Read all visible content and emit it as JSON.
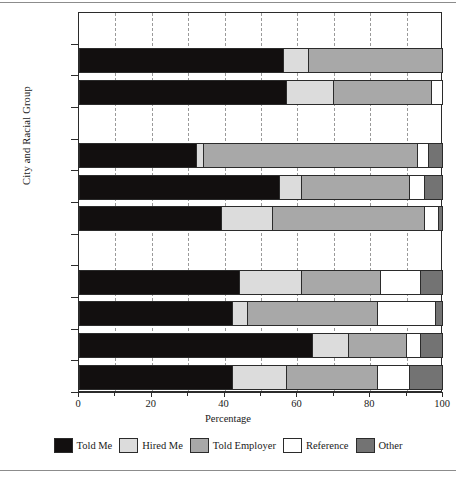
{
  "chart_data": {
    "type": "bar",
    "orientation": "horizontal",
    "stacked": true,
    "title": "",
    "xlabel": "Percentage",
    "ylabel": "City and Racial Group",
    "xlim": [
      0,
      100
    ],
    "xticks": [
      0,
      20,
      40,
      60,
      80,
      100
    ],
    "xticklabels": [
      "0",
      "20",
      "40",
      "60",
      "80",
      "100"
    ],
    "gridlines": "dashed vertical every 10 units",
    "legend_position": "bottom",
    "series": [
      {
        "name": "Told Me",
        "color": "#120f0f"
      },
      {
        "name": "Hired Me",
        "color": "#dcdcdc"
      },
      {
        "name": "Told Employer",
        "color": "#a8a8a8"
      },
      {
        "name": "Reference",
        "color": "#ffffff"
      },
      {
        "name": "Other",
        "color": "#737373"
      }
    ],
    "groups": [
      {
        "city": "Atlanta",
        "rows": [
          {
            "label": "Black",
            "values": [
              56,
              7,
              37,
              0,
              0
            ]
          },
          {
            "label": "Non-Hispanic White",
            "values": [
              57,
              13,
              27,
              3,
              0
            ]
          }
        ]
      },
      {
        "city": "Boston",
        "rows": [
          {
            "label": "Latino",
            "values": [
              32,
              2,
              59,
              3,
              4
            ]
          },
          {
            "label": "Black",
            "values": [
              55,
              6,
              30,
              4,
              5
            ]
          },
          {
            "label": "Non-Hispanic White",
            "values": [
              39,
              14,
              42,
              4,
              1
            ]
          }
        ]
      },
      {
        "city": "Los Angeles",
        "rows": [
          {
            "label": "Asian",
            "values": [
              44,
              17,
              22,
              11,
              6
            ]
          },
          {
            "label": "Latino",
            "values": [
              42,
              4,
              36,
              16,
              2
            ]
          },
          {
            "label": "Black",
            "values": [
              64,
              10,
              16,
              4,
              6
            ]
          },
          {
            "label": "Non-Hispanic White",
            "values": [
              42,
              15,
              25,
              9,
              9
            ]
          }
        ]
      }
    ]
  },
  "axis": {
    "y_title": "City and Racial Group",
    "x_title": "Percentage"
  },
  "categories": [
    {
      "text": "Atlanta",
      "kind": "city"
    },
    {
      "text": "Black",
      "kind": "bar"
    },
    {
      "text": "Non-\nHispanic\nWhite",
      "kind": "bar"
    },
    {
      "text": "Boston",
      "kind": "city"
    },
    {
      "text": "Latino",
      "kind": "bar"
    },
    {
      "text": "Black",
      "kind": "bar"
    },
    {
      "text": "Non-\nHispanic\nWhite",
      "kind": "bar"
    },
    {
      "text": "Los Angeles",
      "kind": "city"
    },
    {
      "text": "Asian",
      "kind": "bar"
    },
    {
      "text": "Latino",
      "kind": "bar"
    },
    {
      "text": "Black",
      "kind": "bar"
    },
    {
      "text": "Non-\nHispanic\nWhite",
      "kind": "bar"
    }
  ],
  "legend": {
    "items": [
      {
        "label": "Told Me",
        "color": "#120f0f"
      },
      {
        "label": "Hired Me",
        "color": "#dcdcdc"
      },
      {
        "label": "Told Employer",
        "color": "#a8a8a8"
      },
      {
        "label": "Reference",
        "color": "#ffffff"
      },
      {
        "label": "Other",
        "color": "#737373"
      }
    ]
  }
}
